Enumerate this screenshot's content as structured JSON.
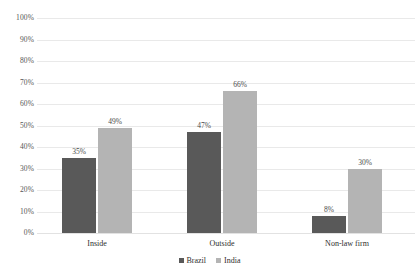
{
  "chart_data": {
    "type": "bar",
    "title": "",
    "subtitle": "",
    "xlabel": "",
    "ylabel": "",
    "ylim": [
      0,
      100
    ],
    "grid": true,
    "legend_position": "bottom-center",
    "categories": [
      "Inside",
      "Outside",
      "Non-law firm"
    ],
    "series": [
      {
        "name": "Brazil",
        "color": "#595959",
        "values": [
          35,
          47,
          8
        ],
        "labels": [
          "35%",
          "47%",
          "8%"
        ]
      },
      {
        "name": "India",
        "color": "#b4b4b4",
        "values": [
          49,
          66,
          30
        ],
        "labels": [
          "49%",
          "66%",
          "30%"
        ]
      }
    ],
    "yticks": [
      {
        "value": 100,
        "label": "100%"
      },
      {
        "value": 90,
        "label": "90%"
      },
      {
        "value": 80,
        "label": "80%"
      },
      {
        "value": 70,
        "label": "70%"
      },
      {
        "value": 60,
        "label": "60%"
      },
      {
        "value": 50,
        "label": "50%"
      },
      {
        "value": 40,
        "label": "40%"
      },
      {
        "value": 30,
        "label": "30%"
      },
      {
        "value": 20,
        "label": "20%"
      },
      {
        "value": 10,
        "label": "10%"
      },
      {
        "value": 0,
        "label": "0%"
      }
    ]
  },
  "colors": {
    "background": "#ffffff",
    "gridline": "#e9e9e9",
    "axis_text": "#555555",
    "label_text": "#2e2e2e",
    "series_brazil": "#595959",
    "series_india": "#b4b4b4"
  }
}
